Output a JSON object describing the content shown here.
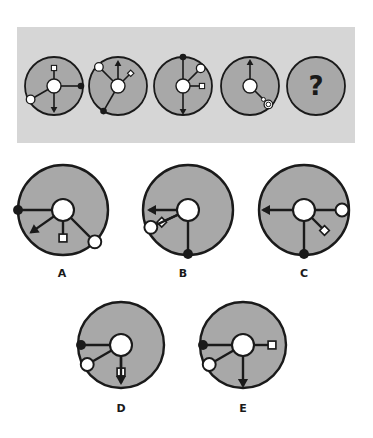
{
  "colors": {
    "page_bg": "#ffffff",
    "panel_bg": "#d6d6d6",
    "disc_fill": "#a8a8a8",
    "outline": "#1a1a1a",
    "white": "#ffffff"
  },
  "sequence": {
    "panel": {
      "x": 17,
      "y": 27,
      "w": 338,
      "h": 116
    },
    "items": [
      {
        "id": "seq-1",
        "cx": 54,
        "cy": 86,
        "r": 29,
        "hub_r": 7,
        "spokes": [
          {
            "angle": 270,
            "len": 11,
            "end": "white-square"
          },
          {
            "angle": 0,
            "len": 20,
            "end": "black-dot"
          },
          {
            "angle": 90,
            "len": 18,
            "end": "arrow"
          },
          {
            "angle": 150,
            "len": 20,
            "end": "white-circle"
          }
        ]
      },
      {
        "id": "seq-2",
        "cx": 118,
        "cy": 86,
        "r": 29,
        "hub_r": 7,
        "spokes": [
          {
            "angle": 270,
            "len": 17,
            "end": "arrow"
          },
          {
            "angle": 315,
            "len": 11,
            "end": "white-diamond"
          },
          {
            "angle": 225,
            "len": 20,
            "end": "white-circle"
          },
          {
            "angle": 120,
            "len": 22,
            "end": "black-dot"
          }
        ]
      },
      {
        "id": "seq-3",
        "cx": 183,
        "cy": 86,
        "r": 29,
        "hub_r": 7,
        "spokes": [
          {
            "angle": 270,
            "len": 22,
            "end": "black-dot"
          },
          {
            "angle": 315,
            "len": 18,
            "end": "white-circle"
          },
          {
            "angle": 0,
            "len": 12,
            "end": "white-square"
          },
          {
            "angle": 90,
            "len": 20,
            "end": "arrow"
          }
        ]
      },
      {
        "id": "seq-4",
        "cx": 250,
        "cy": 86,
        "r": 29,
        "hub_r": 7,
        "spokes": [
          {
            "angle": 270,
            "len": 18,
            "end": "arrow"
          },
          {
            "angle": 45,
            "len": 19,
            "end": "white-circle-with-inner"
          }
        ]
      },
      {
        "id": "seq-5",
        "cx": 316,
        "cy": 86,
        "r": 29,
        "question": "?"
      }
    ]
  },
  "options": [
    {
      "label": "A",
      "cx": 63,
      "cy": 210,
      "r": 45,
      "hub_r": 11,
      "label_x": 62,
      "label_y": 277,
      "spokes": [
        {
          "angle": 180,
          "len": 34,
          "end": "black-dot"
        },
        {
          "angle": 145,
          "len": 28,
          "end": "arrow"
        },
        {
          "angle": 90,
          "len": 17,
          "end": "white-square"
        },
        {
          "angle": 45,
          "len": 34,
          "end": "white-circle"
        }
      ]
    },
    {
      "label": "B",
      "cx": 188,
      "cy": 210,
      "r": 45,
      "hub_r": 11,
      "label_x": 183,
      "label_y": 277,
      "spokes": [
        {
          "angle": 180,
          "len": 28,
          "end": "arrow"
        },
        {
          "angle": 155,
          "len": 18,
          "end": "white-diamond"
        },
        {
          "angle": 155,
          "len": 30,
          "end": "white-circle"
        },
        {
          "angle": 90,
          "len": 33,
          "end": "black-dot"
        }
      ]
    },
    {
      "label": "C",
      "cx": 304,
      "cy": 210,
      "r": 45,
      "hub_r": 11,
      "label_x": 304,
      "label_y": 277,
      "spokes": [
        {
          "angle": 180,
          "len": 30,
          "end": "arrow"
        },
        {
          "angle": 0,
          "len": 27,
          "end": "white-circle"
        },
        {
          "angle": 45,
          "len": 18,
          "end": "white-diamond"
        },
        {
          "angle": 90,
          "len": 33,
          "end": "black-dot"
        }
      ]
    },
    {
      "label": "D",
      "cx": 121,
      "cy": 345,
      "r": 43,
      "hub_r": 11,
      "label_x": 121,
      "label_y": 412,
      "spokes": [
        {
          "angle": 180,
          "len": 29,
          "end": "black-dot"
        },
        {
          "angle": 150,
          "len": 28,
          "end": "white-circle"
        },
        {
          "angle": 90,
          "len": 16,
          "end": "white-square"
        },
        {
          "angle": 90,
          "len": 27,
          "end": "arrow"
        }
      ]
    },
    {
      "label": "E",
      "cx": 243,
      "cy": 345,
      "r": 43,
      "hub_r": 11,
      "label_x": 243,
      "label_y": 412,
      "spokes": [
        {
          "angle": 180,
          "len": 29,
          "end": "black-dot"
        },
        {
          "angle": 150,
          "len": 28,
          "end": "white-circle"
        },
        {
          "angle": 0,
          "len": 18,
          "end": "white-square"
        },
        {
          "angle": 90,
          "len": 30,
          "end": "arrow"
        }
      ]
    }
  ]
}
